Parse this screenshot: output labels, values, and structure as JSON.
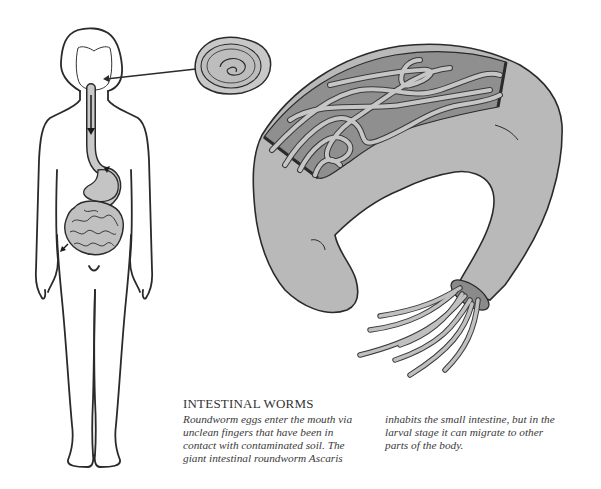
{
  "illustration": {
    "subject": "Intestinal roundworm infection",
    "parts": {
      "human_figure": "human-body-outline-with-digestive-tract",
      "egg": "roundworm-egg",
      "intestine": "cutaway-intestine-with-worms"
    },
    "colors": {
      "outline": "#2a2a2a",
      "organ_fill": "#bdbdbd",
      "intestine_fill": "#b8b8b8",
      "interior_fill": "#8c8c8c",
      "worm_fill": "#c4c4c4",
      "background": "#ffffff"
    }
  },
  "caption": {
    "title": "INTESTINAL WORMS",
    "left_lines": [
      "Roundworm eggs enter the mouth via",
      "unclean fingers that have been in",
      "contact with contaminated soil. The",
      "giant intestinal roundworm Ascaris"
    ],
    "right_lines": [
      "inhabits the small intestine, but in the",
      "larval stage it can migrate to other",
      "parts of the body."
    ]
  }
}
